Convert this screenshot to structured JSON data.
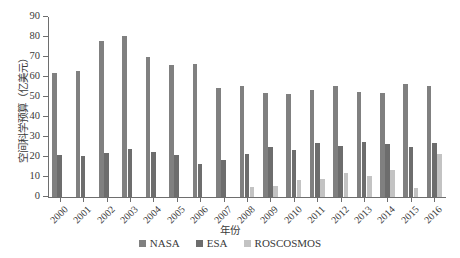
{
  "chart_data": {
    "type": "bar",
    "title": "",
    "xlabel": "年份",
    "ylabel": "空间科学预算（亿美元）",
    "categories": [
      "2000",
      "2001",
      "2002",
      "2003",
      "2004",
      "2005",
      "2006",
      "2007",
      "2008",
      "2009",
      "2010",
      "2011",
      "2012",
      "2013",
      "2014",
      "2015",
      "2016"
    ],
    "series": [
      {
        "name": "NASA",
        "color": "#808080",
        "values": [
          62,
          62.8,
          78,
          80.5,
          69.8,
          66,
          66.3,
          54.3,
          55.5,
          51.8,
          51.5,
          53.5,
          55.5,
          52.3,
          52,
          56.3,
          55.5
        ]
      },
      {
        "name": "ESA",
        "color": "#6d6d6d",
        "values": [
          20.8,
          20.3,
          21.8,
          23.8,
          22.5,
          20.8,
          16.3,
          18.3,
          21.5,
          25,
          23.3,
          26.8,
          25.5,
          27.3,
          26.5,
          24.8,
          27
        ]
      },
      {
        "name": "ROSCOSMOS",
        "color": "#c3c3c3",
        "values": [
          0,
          0,
          0,
          0,
          0,
          0,
          0,
          0,
          4.8,
          5.3,
          8.5,
          8.8,
          11.8,
          10.3,
          13.3,
          4.3,
          21.5
        ]
      }
    ],
    "ylim": [
      0,
      90
    ],
    "yticks": [
      0,
      10,
      20,
      30,
      40,
      50,
      60,
      70,
      80,
      90
    ],
    "grid": false,
    "legend_position": "bottom-center",
    "xtick_rotation": -45
  }
}
